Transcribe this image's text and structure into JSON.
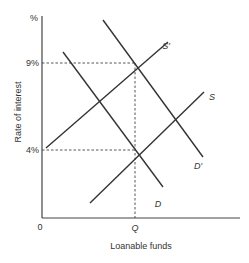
{
  "diagram": {
    "type": "supply-demand",
    "y_axis": {
      "label": "Rate of interest",
      "unit_label": "%",
      "ticks": [
        "9%",
        "4%"
      ]
    },
    "x_axis": {
      "label": "Loanable funds",
      "origin": "0",
      "ticks": [
        "Q"
      ]
    },
    "curves": [
      {
        "id": "D",
        "label": "D",
        "kind": "demand"
      },
      {
        "id": "D_prime",
        "label": "D′",
        "kind": "demand"
      },
      {
        "id": "S",
        "label": "S",
        "kind": "supply"
      },
      {
        "id": "S_prime",
        "label": "S′",
        "kind": "supply"
      }
    ],
    "equilibria": [
      {
        "curves": [
          "D",
          "S"
        ],
        "rate": "4%",
        "quantity": "Q"
      },
      {
        "curves": [
          "D_prime",
          "S_prime"
        ],
        "rate": "9%",
        "quantity": "Q"
      }
    ]
  }
}
